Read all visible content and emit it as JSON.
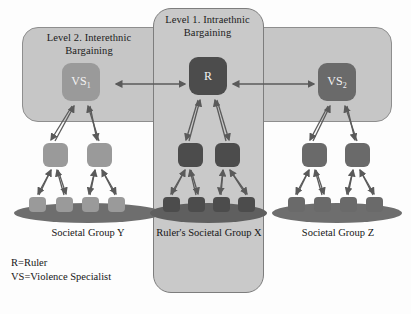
{
  "panels": [
    {
      "id": "level2",
      "label": "Level 2. Interethnic\nBargaining"
    },
    {
      "id": "level1",
      "label": "Level 1. Intraethnic\nBargaining"
    }
  ],
  "nodes": {
    "left_top": {
      "text": "VS",
      "sub": "1"
    },
    "center_top": {
      "text": "R",
      "sub": ""
    },
    "right_top": {
      "text": "VS",
      "sub": "2"
    }
  },
  "groups": [
    {
      "id": "group-y",
      "caption": "Societal Group Y",
      "shade": "light",
      "mid_count": 2,
      "leaf_count": 4
    },
    {
      "id": "group-x",
      "caption": "Ruler's Societal Group X",
      "shade": "dark",
      "mid_count": 2,
      "leaf_count": 4
    },
    {
      "id": "group-z",
      "caption": "Societal Group Z",
      "shade": "mid",
      "mid_count": 2,
      "leaf_count": 4
    }
  ],
  "legend": {
    "line1": "R=Ruler",
    "line2": "VS=Violence Specialist"
  },
  "colors": {
    "panel_fill": "#c9c9c9",
    "panel_border": "#8e8e8e",
    "node_light": "#9a9a9a",
    "node_mid": "#6a6a6a",
    "node_dark": "#4c4c4c",
    "ground": "#6e6e6e",
    "arrow": "#5a5a5a",
    "text": "#161616"
  }
}
